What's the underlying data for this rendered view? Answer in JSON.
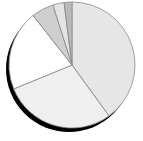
{
  "chart_data": {
    "type": "pie",
    "title": "",
    "legend": [],
    "start_angle_deg": 0,
    "direction": "clockwise",
    "categories": [
      "Slice 1",
      "Slice 2",
      "Slice 3",
      "Slice 4",
      "Slice 5",
      "Slice 6"
    ],
    "values": [
      40.0,
      28.8,
      20.6,
      5.7,
      2.9,
      2.0
    ],
    "colors": [
      "#e6e6e6",
      "#efefef",
      "#ffffff",
      "#cfcfcf",
      "#e3e3e3",
      "#b9b9b9"
    ],
    "shadow": true
  }
}
